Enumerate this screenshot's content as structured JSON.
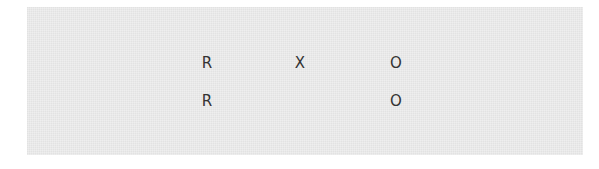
{
  "grid": {
    "rows": [
      {
        "cells": [
          "R",
          "X",
          "O"
        ]
      },
      {
        "cells": [
          "R",
          "",
          "O"
        ]
      }
    ]
  }
}
